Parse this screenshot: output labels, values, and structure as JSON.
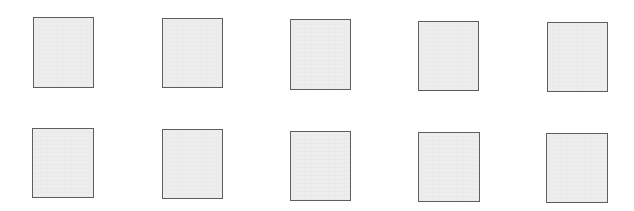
{
  "canvas": {
    "width": 634,
    "height": 211,
    "background": "#ffffff"
  },
  "style": {
    "card_fill": "#ececec",
    "card_border": "#5e5e5e"
  },
  "grid": {
    "rows": 2,
    "columns": 5
  },
  "cards": [
    {
      "row": 1,
      "col": 1,
      "x": 33,
      "y": 17,
      "w": 61,
      "h": 71
    },
    {
      "row": 1,
      "col": 2,
      "x": 162,
      "y": 18,
      "w": 61,
      "h": 70
    },
    {
      "row": 1,
      "col": 3,
      "x": 290,
      "y": 19,
      "w": 61,
      "h": 71
    },
    {
      "row": 1,
      "col": 4,
      "x": 418,
      "y": 21,
      "w": 61,
      "h": 70
    },
    {
      "row": 1,
      "col": 5,
      "x": 547,
      "y": 22,
      "w": 61,
      "h": 70
    },
    {
      "row": 2,
      "col": 1,
      "x": 32,
      "y": 128,
      "w": 62,
      "h": 70
    },
    {
      "row": 2,
      "col": 2,
      "x": 162,
      "y": 129,
      "w": 61,
      "h": 70
    },
    {
      "row": 2,
      "col": 3,
      "x": 290,
      "y": 131,
      "w": 61,
      "h": 70
    },
    {
      "row": 2,
      "col": 4,
      "x": 418,
      "y": 132,
      "w": 62,
      "h": 70
    },
    {
      "row": 2,
      "col": 5,
      "x": 546,
      "y": 133,
      "w": 62,
      "h": 70
    }
  ]
}
